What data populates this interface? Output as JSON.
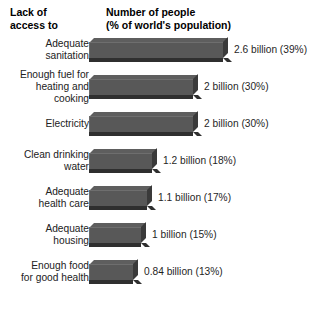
{
  "header": {
    "left_line1": "Lack of",
    "left_line2": "access to",
    "right_line1": "Number of people",
    "right_line2": "(% of world's population)"
  },
  "chart_data": {
    "type": "bar",
    "title": "Number of people (% of world's population)",
    "xlabel": "",
    "ylabel": "Lack of access to",
    "orientation": "horizontal",
    "grid": false,
    "legend": false,
    "unit": "billion",
    "categories": [
      "Adequate sanitation",
      "Enough fuel for heating and cooking",
      "Electricity",
      "Clean drinking water",
      "Adequate health care",
      "Adequate housing",
      "Enough food for good health"
    ],
    "values": [
      2.6,
      2,
      2,
      1.2,
      1.1,
      1,
      0.84
    ],
    "percents": [
      39,
      30,
      30,
      18,
      17,
      15,
      13
    ],
    "xlim": [
      0,
      2.6
    ],
    "bars": [
      {
        "label_lines": [
          "Adequate",
          "sanitation"
        ],
        "value": 2.6,
        "percent": 39,
        "value_label": "2.6 billion (39%)",
        "bar_px": 134
      },
      {
        "label_lines": [
          "Enough fuel for",
          "heating and",
          "cooking"
        ],
        "value": 2,
        "percent": 30,
        "value_label": "2 billion (30%)",
        "bar_px": 104
      },
      {
        "label_lines": [
          "Electricity"
        ],
        "value": 2,
        "percent": 30,
        "value_label": "2 billion (30%)",
        "bar_px": 104
      },
      {
        "label_lines": [
          "Clean drinking",
          "water"
        ],
        "value": 1.2,
        "percent": 18,
        "value_label": "1.2 billion (18%)",
        "bar_px": 63
      },
      {
        "label_lines": [
          "Adequate",
          "health care"
        ],
        "value": 1.1,
        "percent": 17,
        "value_label": "1.1 billion (17%)",
        "bar_px": 58
      },
      {
        "label_lines": [
          "Adequate",
          "housing"
        ],
        "value": 1,
        "percent": 15,
        "value_label": "1 billion (15%)",
        "bar_px": 52
      },
      {
        "label_lines": [
          "Enough food",
          "for good health"
        ],
        "value": 0.84,
        "percent": 13,
        "value_label": "0.84 billion (13%)",
        "bar_px": 44
      }
    ],
    "colors": {
      "bar_front": "#585858",
      "bar_top": "#5e5e5e",
      "bar_side": "#3a3a3a",
      "bar_shadow": "#2f2f2f",
      "text": "#1f1f1f",
      "background": "#ffffff"
    }
  }
}
